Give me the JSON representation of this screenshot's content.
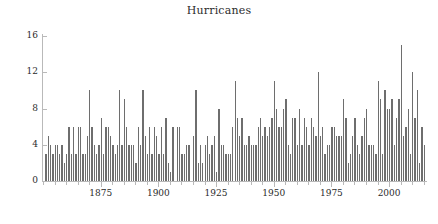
{
  "chart_data": {
    "type": "bar",
    "title": "Hurricanes",
    "xlabel": "",
    "ylabel": "",
    "xlim": [
      1850,
      2016
    ],
    "ylim": [
      0,
      16
    ],
    "grid": false,
    "legend": null,
    "bar_color": "#6e6e6e",
    "background_color": "#ffffff",
    "axis_color": "#b9b9b9",
    "text_color": "#2b2b2b",
    "y_ticks": [
      0,
      4,
      8,
      12,
      16
    ],
    "x_ticks_major": [
      1875,
      1900,
      1925,
      1950,
      1975,
      2000
    ],
    "x_tick_minor_step": 5,
    "x_tick_labels": [
      "1875",
      "1900",
      "1925",
      "1950",
      "1975",
      "2000"
    ],
    "y_tick_labels": [
      "0",
      "4",
      "8",
      "12",
      "16"
    ],
    "categories": [
      1851,
      1852,
      1853,
      1854,
      1855,
      1856,
      1857,
      1858,
      1859,
      1860,
      1861,
      1862,
      1863,
      1864,
      1865,
      1866,
      1867,
      1868,
      1869,
      1870,
      1871,
      1872,
      1873,
      1874,
      1875,
      1876,
      1877,
      1878,
      1879,
      1880,
      1881,
      1882,
      1883,
      1884,
      1885,
      1886,
      1887,
      1888,
      1889,
      1890,
      1891,
      1892,
      1893,
      1894,
      1895,
      1896,
      1897,
      1898,
      1899,
      1900,
      1901,
      1902,
      1903,
      1904,
      1905,
      1906,
      1907,
      1908,
      1909,
      1910,
      1911,
      1912,
      1913,
      1914,
      1915,
      1916,
      1917,
      1918,
      1919,
      1920,
      1921,
      1922,
      1923,
      1924,
      1925,
      1926,
      1927,
      1928,
      1929,
      1930,
      1931,
      1932,
      1933,
      1934,
      1935,
      1936,
      1937,
      1938,
      1939,
      1940,
      1941,
      1942,
      1943,
      1944,
      1945,
      1946,
      1947,
      1948,
      1949,
      1950,
      1951,
      1952,
      1953,
      1954,
      1955,
      1956,
      1957,
      1958,
      1959,
      1960,
      1961,
      1962,
      1963,
      1964,
      1965,
      1966,
      1967,
      1968,
      1969,
      1970,
      1971,
      1972,
      1973,
      1974,
      1975,
      1976,
      1977,
      1978,
      1979,
      1980,
      1981,
      1982,
      1983,
      1984,
      1985,
      1986,
      1987,
      1988,
      1989,
      1990,
      1991,
      1992,
      1993,
      1994,
      1995,
      1996,
      1997,
      1998,
      1999,
      2000,
      2001,
      2002,
      2003,
      2004,
      2005,
      2006,
      2007,
      2008,
      2009,
      2010,
      2011,
      2012,
      2013,
      2014,
      2015
    ],
    "values": [
      3,
      5,
      4,
      3,
      4,
      4,
      3,
      4,
      2,
      3,
      6,
      3,
      6,
      3,
      6,
      6,
      3,
      3,
      5,
      10,
      6,
      4,
      3,
      4,
      7,
      3,
      6,
      6,
      5,
      4,
      3,
      4,
      10,
      4,
      9,
      6,
      4,
      4,
      4,
      2,
      6,
      4,
      10,
      5,
      3,
      6,
      3,
      6,
      5,
      3,
      6,
      3,
      7,
      2,
      1,
      6,
      0,
      6,
      6,
      3,
      3,
      4,
      4,
      0,
      5,
      10,
      2,
      4,
      2,
      4,
      5,
      3,
      4,
      5,
      1,
      8,
      4,
      4,
      3,
      3,
      3,
      6,
      11,
      7,
      5,
      7,
      4,
      4,
      5,
      4,
      4,
      4,
      6,
      7,
      5,
      6,
      5,
      6,
      7,
      11,
      8,
      6,
      6,
      8,
      9,
      4,
      3,
      7,
      7,
      4,
      8,
      4,
      7,
      6,
      4,
      7,
      6,
      5,
      12,
      5,
      6,
      3,
      4,
      4,
      6,
      6,
      5,
      5,
      5,
      9,
      7,
      2,
      3,
      5,
      7,
      4,
      3,
      5,
      7,
      8,
      4,
      4,
      4,
      3,
      11,
      9,
      3,
      10,
      8,
      8,
      9,
      4,
      7,
      9,
      15,
      5,
      6,
      8,
      3,
      12,
      7,
      10,
      2,
      6,
      4
    ],
    "data_labels": null
  }
}
